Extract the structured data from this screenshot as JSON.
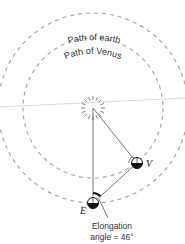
{
  "diagram": {
    "labels": {
      "earth_path": "Path of earth",
      "venus_path": "Path of Venus",
      "venus": "V",
      "earth": "E",
      "elongation_line1": "Elongation",
      "elongation_line2": "angle = 46°"
    },
    "values": {
      "elongation_angle_deg": 46
    },
    "colors": {
      "orbit": "#a8a8a8",
      "line": "#555555",
      "planet_dark": "#111111"
    }
  }
}
